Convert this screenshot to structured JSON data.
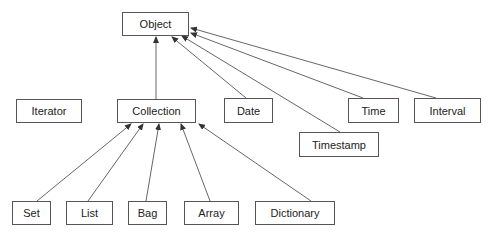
{
  "diagram": {
    "type": "class-hierarchy",
    "nodes": {
      "object": {
        "label": "Object",
        "x": 122,
        "y": 12,
        "w": 67,
        "h": 24
      },
      "iterator": {
        "label": "Iterator",
        "x": 16,
        "y": 99,
        "w": 66,
        "h": 24
      },
      "collection": {
        "label": "Collection",
        "x": 117,
        "y": 99,
        "w": 79,
        "h": 24
      },
      "date": {
        "label": "Date",
        "x": 224,
        "y": 98,
        "w": 49,
        "h": 25
      },
      "time": {
        "label": "Time",
        "x": 348,
        "y": 98,
        "w": 51,
        "h": 25
      },
      "interval": {
        "label": "Interval",
        "x": 414,
        "y": 98,
        "w": 67,
        "h": 25
      },
      "timestamp": {
        "label": "Timestamp",
        "x": 299,
        "y": 132,
        "w": 80,
        "h": 25
      },
      "set": {
        "label": "Set",
        "x": 12,
        "y": 201,
        "w": 39,
        "h": 24
      },
      "list": {
        "label": "List",
        "x": 66,
        "y": 201,
        "w": 47,
        "h": 24
      },
      "bag": {
        "label": "Bag",
        "x": 128,
        "y": 201,
        "w": 39,
        "h": 24
      },
      "array": {
        "label": "Array",
        "x": 184,
        "y": 201,
        "w": 55,
        "h": 24
      },
      "dictionary": {
        "label": "Dictionary",
        "x": 255,
        "y": 201,
        "w": 80,
        "h": 24
      }
    },
    "edges": [
      {
        "from": "collection",
        "to": "object",
        "x1": 156,
        "y1": 99,
        "x2": 156,
        "y2": 37
      },
      {
        "from": "date",
        "to": "object",
        "x1": 246,
        "y1": 98,
        "x2": 172,
        "y2": 37
      },
      {
        "from": "timestamp",
        "to": "object",
        "x1": 340,
        "y1": 132,
        "x2": 182,
        "y2": 36
      },
      {
        "from": "time",
        "to": "object",
        "x1": 363,
        "y1": 98,
        "x2": 191,
        "y2": 33
      },
      {
        "from": "interval",
        "to": "object",
        "x1": 436,
        "y1": 98,
        "x2": 191,
        "y2": 28
      },
      {
        "from": "set",
        "to": "collection",
        "x1": 37,
        "y1": 201,
        "x2": 131,
        "y2": 124
      },
      {
        "from": "list",
        "to": "collection",
        "x1": 88,
        "y1": 201,
        "x2": 143,
        "y2": 124
      },
      {
        "from": "bag",
        "to": "collection",
        "x1": 146,
        "y1": 201,
        "x2": 159,
        "y2": 124
      },
      {
        "from": "array",
        "to": "collection",
        "x1": 210,
        "y1": 201,
        "x2": 181,
        "y2": 124
      },
      {
        "from": "dictionary",
        "to": "collection",
        "x1": 311,
        "y1": 201,
        "x2": 199,
        "y2": 124
      }
    ],
    "colors": {
      "stroke": "#555555",
      "text": "#222222",
      "background": "#ffffff"
    }
  }
}
